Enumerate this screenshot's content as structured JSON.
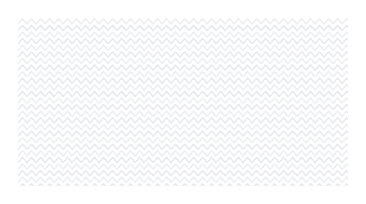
{
  "artwork": {
    "title": "Chevron Wave Pattern Swatch",
    "kind": "seamless-decorative-background",
    "description": "Repeating horizontal zigzag wave lines, very light gray on white",
    "canvas": {
      "width": 366,
      "height": 204,
      "background_color": "#ffffff"
    },
    "pattern_area": {
      "x": 18,
      "y": 18,
      "width": 330,
      "height": 168,
      "inset": 18
    },
    "motif": {
      "shape": "zigzag-wave",
      "orientation": "horizontal",
      "wave_period_px": 9,
      "wave_amplitude_px": 2.6,
      "row_spacing_px": 6.6,
      "row_count": 26,
      "stroke_width_px": 1.5,
      "stroke_color": "#eceef0",
      "stroke_color_alt": "#e7e9ec",
      "phase_offset_px": 0,
      "line_cap": "round",
      "line_join": "round"
    },
    "palette": {
      "background": "#ffffff",
      "line_light": "#eceef0",
      "line_mid": "#e7e9ec",
      "margin": "#ffffff"
    }
  }
}
